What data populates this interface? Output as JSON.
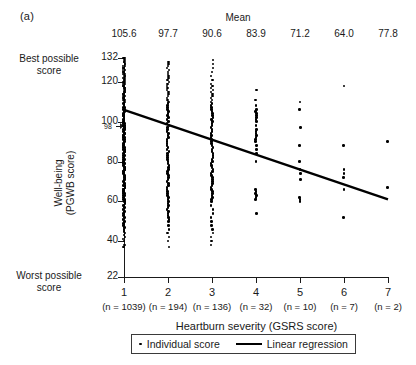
{
  "panel_label": "(a)",
  "mean_header": "Mean",
  "means": [
    "105.6",
    "97.7",
    "90.6",
    "83.9",
    "71.2",
    "64.0",
    "77.8"
  ],
  "axis": {
    "ylabel_line1": "Well-being",
    "ylabel_line2": "(PGWB score)",
    "xlabel": "Heartburn severity (GSRS score)",
    "ytick_labels": [
      "132",
      "120",
      "100",
      "80",
      "60",
      "40",
      "22"
    ],
    "ytick_values": [
      132,
      120,
      100,
      80,
      60,
      40,
      22
    ],
    "special_ytick_label": "98",
    "xtick_labels": [
      "1",
      "2",
      "3",
      "4",
      "5",
      "6",
      "7"
    ],
    "sample_sizes": [
      "(n = 1039)",
      "(n = 194)",
      "(n = 136)",
      "(n = 32)",
      "(n = 10)",
      "(n = 7)",
      "(n = 2)"
    ],
    "best_note": "Best possible score",
    "worst_note": "Worst possible score",
    "ylim": [
      22,
      132
    ],
    "xlim": [
      0.5,
      7.5
    ],
    "grid": false
  },
  "legend": {
    "position": "bottom-center",
    "individual_label": "Individual score",
    "regression_label": "Linear regression"
  },
  "colors": {
    "marker": "#000000",
    "line": "#000000",
    "axis": "#1a1a1a",
    "background": "#ffffff"
  },
  "chart_data": {
    "type": "scatter",
    "title": "",
    "subtitle": "",
    "xlabel": "Heartburn severity (GSRS score)",
    "ylabel": "Well-being (PGWB score)",
    "xlim": [
      0.5,
      7.5
    ],
    "ylim": [
      22,
      132
    ],
    "grid": false,
    "legend_position": "bottom-center",
    "annotations": [
      {
        "text": "Mean",
        "role": "column-header-title"
      },
      {
        "text": "Best possible score",
        "role": "y-axis-top-note",
        "value": 132
      },
      {
        "text": "Worst possible score",
        "role": "y-axis-bottom-note",
        "value": 22
      },
      {
        "text": "98",
        "role": "reference-marker",
        "value": 98
      }
    ],
    "categories": [
      1,
      2,
      3,
      4,
      5,
      6,
      7
    ],
    "group_means": [
      105.6,
      97.7,
      90.6,
      83.9,
      71.2,
      64.0,
      77.8
    ],
    "group_counts": [
      1039,
      194,
      136,
      32,
      10,
      7,
      2
    ],
    "series": [
      {
        "name": "Individual score",
        "type": "scatter",
        "groups": [
          {
            "x": 1,
            "n": 1039,
            "y": [
              132,
              132,
              131,
              131,
              130,
              130,
              129,
              129,
              128,
              128,
              127,
              127,
              126,
              126,
              125,
              125,
              124,
              124,
              123,
              123,
              122,
              122,
              121,
              121,
              120,
              120,
              119,
              119,
              118,
              118,
              117,
              117,
              116,
              116,
              115,
              115,
              114,
              114,
              113,
              113,
              112,
              112,
              111,
              111,
              110,
              110,
              109,
              109,
              108,
              108,
              107,
              107,
              106,
              106,
              105,
              105,
              104,
              104,
              103,
              103,
              102,
              102,
              101,
              101,
              100,
              100,
              99,
              99,
              98,
              98,
              97,
              97,
              96,
              96,
              95,
              95,
              94,
              94,
              93,
              93,
              92,
              92,
              91,
              91,
              90,
              90,
              89,
              89,
              88,
              88,
              87,
              87,
              86,
              86,
              85,
              85,
              84,
              84,
              83,
              83,
              82,
              82,
              81,
              81,
              80,
              80,
              79,
              79,
              78,
              78,
              77,
              77,
              76,
              76,
              75,
              75,
              74,
              74,
              73,
              73,
              72,
              72,
              71,
              71,
              70,
              70,
              69,
              69,
              68,
              68,
              67,
              67,
              66,
              66,
              65,
              65,
              64,
              64,
              63,
              63,
              62,
              62,
              61,
              61,
              60,
              60,
              59,
              58,
              57,
              56,
              55,
              54,
              53,
              52,
              51,
              50,
              49,
              48,
              47,
              46,
              45,
              44,
              43,
              42,
              41,
              40,
              38,
              37
            ]
          },
          {
            "x": 2,
            "n": 194,
            "y": [
              130,
              129,
              128,
              127,
              126,
              125,
              124,
              123,
              122,
              121,
              120,
              119,
              118,
              117,
              116,
              115,
              114,
              113,
              112,
              111,
              110,
              109,
              108,
              107,
              106,
              105,
              104,
              103,
              102,
              101,
              100,
              99,
              98,
              97,
              96,
              95,
              94,
              93,
              92,
              91,
              90,
              89,
              88,
              87,
              86,
              85,
              84,
              83,
              82,
              81,
              80,
              79,
              78,
              77,
              76,
              75,
              74,
              73,
              72,
              71,
              70,
              69,
              68,
              67,
              66,
              65,
              64,
              63,
              62,
              61,
              60,
              59,
              58,
              57,
              56,
              55,
              54,
              53,
              52,
              51,
              50,
              48,
              46,
              44,
              42,
              40,
              37
            ]
          },
          {
            "x": 3,
            "n": 136,
            "y": [
              131,
              129,
              127,
              125,
              123,
              121,
              119,
              118,
              117,
              116,
              115,
              114,
              113,
              112,
              111,
              110,
              109,
              108,
              107,
              106,
              105,
              104,
              103,
              102,
              101,
              100,
              99,
              98,
              97,
              96,
              95,
              94,
              93,
              92,
              91,
              90,
              89,
              88,
              87,
              86,
              85,
              84,
              83,
              82,
              81,
              80,
              79,
              78,
              77,
              76,
              75,
              74,
              73,
              72,
              71,
              70,
              69,
              68,
              67,
              66,
              65,
              64,
              63,
              62,
              61,
              60,
              58,
              56,
              54,
              52,
              50,
              48,
              46,
              44,
              42,
              40,
              38
            ]
          },
          {
            "x": 4,
            "n": 32,
            "y": [
              116,
              111,
              108,
              106,
              105,
              104,
              103,
              102,
              101,
              100,
              98,
              96,
              95,
              94,
              93,
              92,
              91,
              90,
              88,
              86,
              84,
              80,
              66,
              65,
              64,
              63,
              62,
              61,
              54
            ]
          },
          {
            "x": 5,
            "n": 10,
            "y": [
              110,
              106,
              97,
              88,
              80,
              76,
              74,
              71,
              62,
              61,
              60
            ]
          },
          {
            "x": 6,
            "n": 7,
            "y": [
              118,
              88,
              76,
              74,
              72,
              66,
              52
            ]
          },
          {
            "x": 7,
            "n": 2,
            "y": [
              90,
              67
            ]
          }
        ]
      },
      {
        "name": "Linear regression",
        "type": "line",
        "x": [
          1,
          7
        ],
        "y": [
          106,
          61
        ]
      }
    ]
  }
}
